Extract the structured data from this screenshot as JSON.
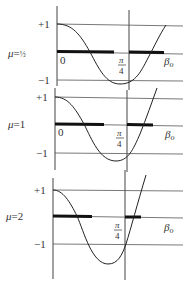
{
  "figure": {
    "panels": [
      {
        "mu_label": "μ = ½",
        "y_ticks": [
          "+1",
          "−1"
        ],
        "origin_label": "0",
        "x_mark_label": "π/4",
        "x_mark_num": "π",
        "x_mark_den": "4",
        "x_axis_label": "β₀"
      },
      {
        "mu_label": "μ = 1",
        "y_ticks": [
          "+1",
          "−1"
        ],
        "origin_label": "0",
        "x_mark_label": "π/4",
        "x_mark_num": "π",
        "x_mark_den": "4",
        "x_axis_label": "β₀"
      },
      {
        "mu_label": "μ = 2",
        "y_ticks": [
          "+1",
          "−1"
        ],
        "origin_label": "",
        "x_mark_label": "π/4",
        "x_mark_num": "π",
        "x_mark_den": "4",
        "x_axis_label": "β₀"
      }
    ],
    "colors": {
      "ink": "#222222",
      "bar": "#111111",
      "background": "#ffffff"
    }
  }
}
